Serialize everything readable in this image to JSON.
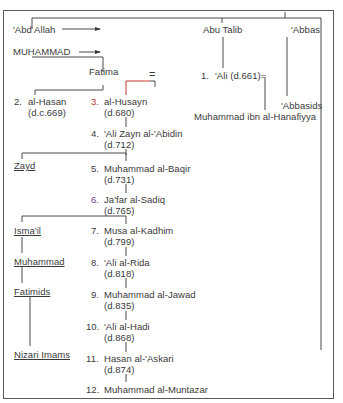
{
  "diagram": {
    "type": "genealogy",
    "colors": {
      "line": "#4a4a4a",
      "accent_red": "#c0392b",
      "accent_purple": "#6a3d8f",
      "frame": "#5a5a5a"
    },
    "ancestors": {
      "abd_allah": "'Abd Allah",
      "muhammad": "MUHAMMAD",
      "abu_talib": "Abu Talib",
      "abbas": "'Abbas",
      "fatima": "Fatima",
      "marriage_symbol": "="
    },
    "ali": {
      "num": "1.",
      "name": "'Ali (d.661)="
    },
    "side_branches": {
      "hanafiyya": "Muhammad ibn al-Hanafiyya",
      "abbasids": "'Abbasids",
      "zayd": "Zayd",
      "ismail": "Isma'il",
      "muhammad_b_ismail": "Muhammad",
      "fatimids": "Fatimids",
      "nizari": "Nizari Imams"
    },
    "imams": [
      {
        "num": "2.",
        "name": "al-Hasan",
        "death": "(d.c.669)"
      },
      {
        "num": "3.",
        "name": "al-Husayn",
        "death": "(d.680)"
      },
      {
        "num": "4.",
        "name": "'Ali Zayn al-'Abidin",
        "death": "(d.712)"
      },
      {
        "num": "5.",
        "name": "Muhammad al-Baqir",
        "death": "(d.731)"
      },
      {
        "num": "6.",
        "name": "Ja'far al-Sadiq",
        "death": "(d.765)"
      },
      {
        "num": "7.",
        "name": "Musa al-Kadhim",
        "death": "(d.799)"
      },
      {
        "num": "8.",
        "name": "'Ali al-Rida",
        "death": "(d.818)"
      },
      {
        "num": "9.",
        "name": "Muhammad al-Jawad",
        "death": "(d.835)"
      },
      {
        "num": "10.",
        "name": "'Ali al-Hadi",
        "death": "(d.868)"
      },
      {
        "num": "11.",
        "name": "Hasan al-'Askari",
        "death": "(d.874)"
      },
      {
        "num": "12.",
        "name": "Muhammad al-Muntazar",
        "death": ""
      }
    ]
  }
}
